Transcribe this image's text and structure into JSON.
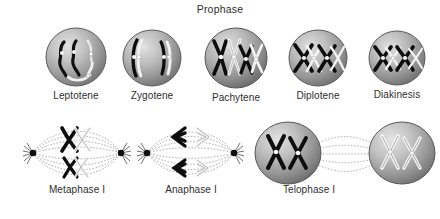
{
  "figure": {
    "title": "Prophase"
  },
  "rows": [
    {
      "name": "prophase-row",
      "stages": [
        {
          "label": "Leptotene",
          "icon": "cell-sphere-icon",
          "chromatin": "thin-threads"
        },
        {
          "label": "Zygotene",
          "icon": "cell-sphere-icon",
          "chromatin": "paired-threads"
        },
        {
          "label": "Pachytene",
          "icon": "cell-sphere-icon",
          "chromatin": "bivalent-thick"
        },
        {
          "label": "Diplotene",
          "icon": "cell-sphere-icon",
          "chromatin": "chiasmata"
        },
        {
          "label": "Diakinesis",
          "icon": "cell-sphere-icon",
          "chromatin": "condensed-bivalents"
        }
      ]
    },
    {
      "name": "division-row",
      "stages": [
        {
          "label": "Metaphase I",
          "icon": "spindle-icon",
          "chromatin": "aligned-bivalents"
        },
        {
          "label": "Anaphase I",
          "icon": "spindle-icon",
          "chromatin": "migrating-homologs"
        },
        {
          "label": "Telophase I",
          "icon": "daughter-cells-icon",
          "chromatin": "two-nuclei"
        }
      ]
    }
  ],
  "colors": {
    "background": "#ffffff",
    "text": "#2e2e2e",
    "cell_light": "#d8d8d8",
    "cell_mid": "#a8a8a8",
    "cell_dark": "#6f6f6f",
    "cell_rim": "#5a5a5a",
    "chromosome_dark": "#111111",
    "chromosome_light": "#f2f2f2",
    "spindle_fiber": "#9a9a9a",
    "pole": "#111111"
  }
}
